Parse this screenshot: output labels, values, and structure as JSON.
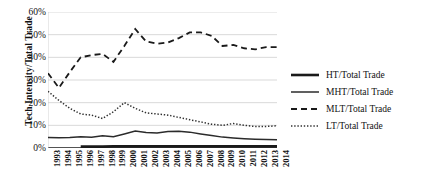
{
  "chart_data": {
    "type": "line",
    "title": "",
    "xlabel": "",
    "ylabel": "Tech Intensity/Total Trade",
    "ylim": [
      0,
      60
    ],
    "yticks": [
      "0%",
      "10%",
      "20%",
      "30%",
      "40%",
      "50%",
      "60%"
    ],
    "ytick_values": [
      0,
      10,
      20,
      30,
      40,
      50,
      60
    ],
    "grid": true,
    "legend_position": "right",
    "categories": [
      "1993",
      "1994",
      "1995",
      "1996",
      "1997",
      "1998",
      "1999",
      "2000",
      "2001",
      "2002",
      "2003",
      "2004",
      "2005",
      "2006",
      "2007",
      "2008",
      "2009",
      "2010",
      "2011",
      "2012",
      "2013",
      "2014"
    ],
    "series": [
      {
        "name": "HT/Total Trade",
        "style": "solid-thick",
        "color": "#1a1a1a",
        "values": [
          null,
          null,
          null,
          0.6,
          0.6,
          0.6,
          0.7,
          0.7,
          0.7,
          0.7,
          0.7,
          0.7,
          0.7,
          0.7,
          0.7,
          0.7,
          0.7,
          0.7,
          0.7,
          0.7,
          0.7,
          0.7
        ]
      },
      {
        "name": "MHT/Total Trade",
        "style": "solid-thin",
        "color": "#2b2b2b",
        "values": [
          4.6,
          4.5,
          4.6,
          5.0,
          4.7,
          5.4,
          5.0,
          6.2,
          7.5,
          6.8,
          6.6,
          7.3,
          7.4,
          7.0,
          6.2,
          5.5,
          4.8,
          4.4,
          4.1,
          3.9,
          3.7,
          3.6
        ]
      },
      {
        "name": "MLT/Total Trade",
        "style": "dashed",
        "color": "#1a1a1a",
        "values": [
          33.0,
          26.5,
          33.5,
          40.0,
          41.0,
          41.5,
          38.0,
          45.0,
          52.5,
          47.0,
          46.0,
          46.5,
          48.5,
          51.0,
          51.0,
          49.5,
          45.0,
          45.5,
          44.0,
          43.5,
          44.5,
          44.5
        ]
      },
      {
        "name": "LT/Total Trade",
        "style": "dotted",
        "color": "#303030",
        "values": [
          25.0,
          21.0,
          17.5,
          15.0,
          14.5,
          13.0,
          16.0,
          20.0,
          17.5,
          15.5,
          15.0,
          14.5,
          13.5,
          12.5,
          11.5,
          10.5,
          10.0,
          10.8,
          10.0,
          9.5,
          9.5,
          9.8
        ]
      }
    ]
  },
  "legend": {
    "entries": [
      {
        "label": "HT/Total Trade",
        "style": "solid-thick"
      },
      {
        "label": "MHT/Total Trade",
        "style": "solid-thin"
      },
      {
        "label": "MLT/Total Trade",
        "style": "dashed"
      },
      {
        "label": "LT/Total Trade",
        "style": "dotted"
      }
    ]
  },
  "colors": {
    "grid": "#c8c8c8",
    "axis": "#1a1a1a",
    "background": "#ffffff",
    "text": "#111111"
  }
}
